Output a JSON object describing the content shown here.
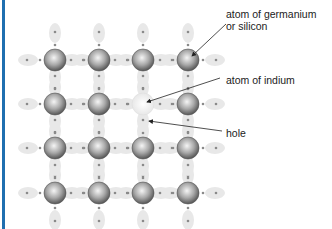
{
  "diagram": {
    "labels": {
      "germanium_line1": "atom of germanium",
      "germanium_line2": "or silicon",
      "indium": "atom of indium",
      "hole": "hole"
    },
    "grid": {
      "columns_x": [
        55,
        99,
        143,
        188
      ],
      "rows_y": [
        60,
        104,
        148,
        193
      ],
      "indium_position": {
        "col": 2,
        "row": 1
      }
    },
    "colors": {
      "border": "#1f6fb0",
      "bond": "#e6e6e6",
      "atom_dark": "#6a6a6a",
      "atom_light": "#f2f2f2"
    }
  }
}
